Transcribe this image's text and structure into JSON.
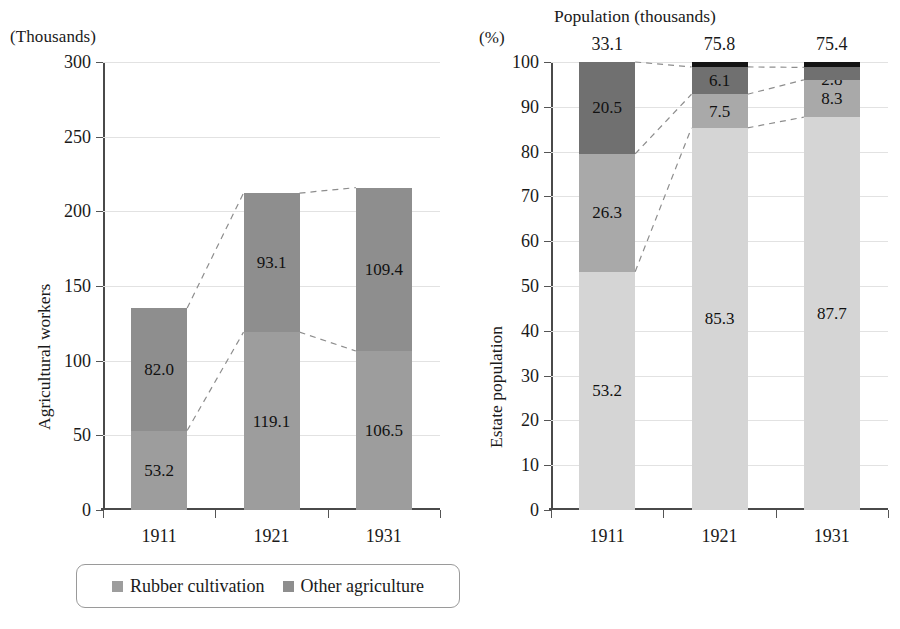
{
  "figure": {
    "background": "#ffffff",
    "panels": [
      "agricultural-workers",
      "estate-population"
    ]
  },
  "left_chart": {
    "unit_caption": "(Thousands)",
    "y_axis_title": "Agricultural workers",
    "y_ticks": [
      "0",
      "50",
      "100",
      "150",
      "200",
      "250",
      "300"
    ],
    "x_ticks": [
      "1911",
      "1921",
      "1931"
    ],
    "legend": [
      {
        "label": "Rubber cultivation",
        "color": "#9d9d9d"
      },
      {
        "label": "Other agriculture",
        "color": "#8e8e8e"
      }
    ]
  },
  "right_chart": {
    "unit_caption": "(%)",
    "title": "Population (thousands)",
    "y_axis_title": "Estate population",
    "y_ticks": [
      "0",
      "10",
      "20",
      "30",
      "40",
      "50",
      "60",
      "70",
      "80",
      "90",
      "100"
    ],
    "x_ticks": [
      "1911",
      "1921",
      "1931"
    ],
    "totals": [
      "33.1",
      "75.8",
      "75.4"
    ],
    "legend": [
      {
        "label": "Indians",
        "color": "#d5d5d5"
      },
      {
        "label": "Chinese",
        "color": "#a9a9a9"
      },
      {
        "label": "Malays",
        "color": "#707070"
      },
      {
        "label": "Others",
        "color": "#141414"
      }
    ]
  },
  "chart_data": [
    {
      "type": "bar",
      "id": "agricultural-workers",
      "stacked": true,
      "title": "",
      "subtitle": "(Thousands)",
      "xlabel": "",
      "ylabel": "Agricultural workers",
      "ylim": [
        0,
        300
      ],
      "ytick_step": 50,
      "grid": true,
      "legend_position": "bottom",
      "categories": [
        "1911",
        "1921",
        "1931"
      ],
      "series": [
        {
          "name": "Rubber cultivation",
          "color": "#9d9d9d",
          "values": [
            53.2,
            119.1,
            106.5
          ],
          "labels": [
            "53.2",
            "119.1",
            "106.5"
          ]
        },
        {
          "name": "Other agriculture",
          "color": "#8e8e8e",
          "values": [
            82.0,
            93.1,
            109.4
          ],
          "labels": [
            "82.0",
            "93.1",
            "109.4"
          ]
        }
      ],
      "totals": [
        135.2,
        212.2,
        215.9
      ],
      "connectors": "dashed lines joining like segment boundaries between adjacent bars"
    },
    {
      "type": "bar",
      "id": "estate-population",
      "stacked": true,
      "normalized": true,
      "title": "Population (thousands)",
      "subtitle": "(%)",
      "xlabel": "",
      "ylabel": "Estate population",
      "ylim": [
        0,
        100
      ],
      "ytick_step": 10,
      "grid": true,
      "legend_position": "bottom",
      "categories": [
        "1911",
        "1921",
        "1931"
      ],
      "series": [
        {
          "name": "Indians",
          "color": "#d5d5d5",
          "values": [
            53.2,
            85.3,
            87.7
          ],
          "labels": [
            "53.2",
            "85.3",
            "87.7"
          ]
        },
        {
          "name": "Chinese",
          "color": "#a9a9a9",
          "values": [
            26.3,
            7.5,
            8.3
          ],
          "labels": [
            "26.3",
            "7.5",
            "8.3"
          ]
        },
        {
          "name": "Malays",
          "color": "#707070",
          "values": [
            20.5,
            6.1,
            2.8
          ],
          "labels": [
            "20.5",
            "6.1",
            "2.8"
          ]
        },
        {
          "name": "Others",
          "color": "#141414",
          "values": [
            0.0,
            1.1,
            1.2
          ],
          "labels": [
            "",
            "",
            ""
          ]
        }
      ],
      "annotations": {
        "above_bars_label": "Population (thousands)",
        "above_bars_values": [
          "33.1",
          "75.8",
          "75.4"
        ]
      },
      "connectors": "dashed lines joining like segment boundaries between adjacent bars"
    }
  ]
}
